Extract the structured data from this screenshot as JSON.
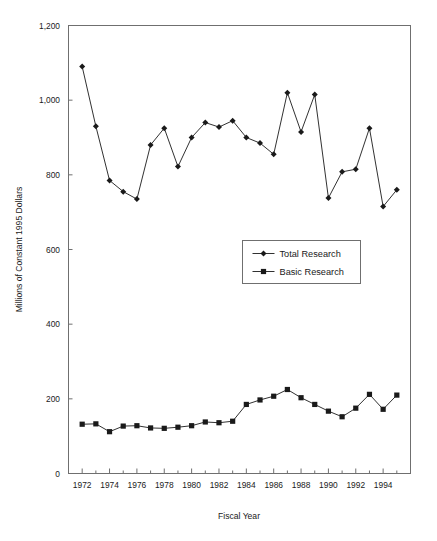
{
  "chart_data": {
    "type": "line",
    "title": "",
    "subtitle": "",
    "xlabel": "Fiscal Year",
    "ylabel": "Millions of Constant 1995 Dollars",
    "xlim": [
      1971,
      1996
    ],
    "ylim": [
      0,
      1200
    ],
    "grid": false,
    "legend_position": "center",
    "x": [
      1972,
      1973,
      1974,
      1975,
      1976,
      1977,
      1978,
      1979,
      1980,
      1981,
      1982,
      1983,
      1984,
      1985,
      1986,
      1987,
      1988,
      1989,
      1990,
      1991,
      1992,
      1993,
      1994,
      1995
    ],
    "x_tick_labels": [
      "1972",
      "1974",
      "1976",
      "1978",
      "1980",
      "1982",
      "1984",
      "1986",
      "1988",
      "1990",
      "1992",
      "1994"
    ],
    "y_tick_labels": [
      "0",
      "200",
      "400",
      "600",
      "800",
      "1,000",
      "1,200"
    ],
    "y_ticks": [
      0,
      200,
      400,
      600,
      800,
      1000,
      1200
    ],
    "series": [
      {
        "name": "Total Research",
        "marker": "diamond",
        "color": "#1a1a1a",
        "values": [
          1090,
          930,
          785,
          755,
          735,
          880,
          925,
          822,
          900,
          940,
          928,
          945,
          900,
          885,
          855,
          1020,
          915,
          1015,
          738,
          808,
          815,
          925,
          715,
          760
        ]
      },
      {
        "name": "Basic Research",
        "marker": "square",
        "color": "#1a1a1a",
        "values": [
          132,
          133,
          112,
          127,
          128,
          122,
          121,
          124,
          128,
          138,
          136,
          140,
          185,
          197,
          207,
          225,
          203,
          185,
          167,
          152,
          175,
          212,
          172,
          210
        ]
      }
    ]
  },
  "axis": {
    "y_title": "Millions of Constant 1995 Dollars",
    "x_title": "Fiscal Year"
  },
  "legend": {
    "items": [
      {
        "label": "Total Research",
        "marker": "diamond"
      },
      {
        "label": "Basic Research",
        "marker": "square"
      }
    ]
  },
  "page": {
    "top_artifact": ""
  }
}
